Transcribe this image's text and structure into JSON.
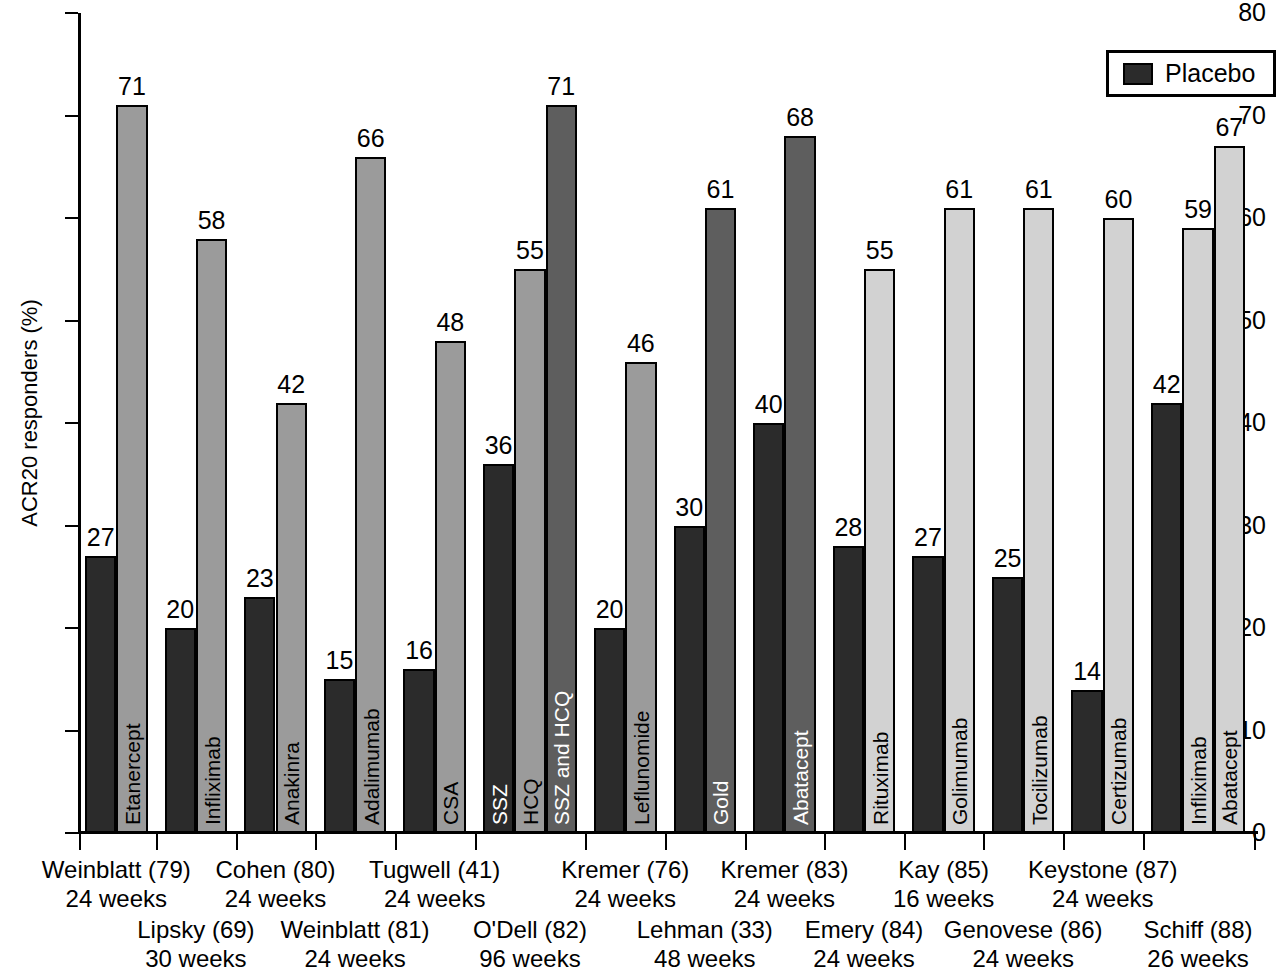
{
  "chart_data": {
    "type": "bar",
    "title": "",
    "xlabel": "",
    "ylabel": "ACR20 responders (%)",
    "ylim": [
      0,
      80
    ],
    "ytick_labels": [
      "0",
      "10",
      "20",
      "30",
      "40",
      "50",
      "60",
      "70",
      "80"
    ],
    "yticks": [
      0,
      10,
      20,
      30,
      40,
      50,
      60,
      70,
      80
    ],
    "grid": false,
    "legend": {
      "position": "top-right",
      "entries": [
        {
          "label": "Placebo",
          "color": "#2b2b2b"
        }
      ]
    },
    "colors": {
      "placebo": "#2b2b2b",
      "active_medium": "#9b9b9b",
      "active_dark": "#5e5e5e",
      "active_light": "#d2d2d2",
      "axis": "#000000"
    },
    "groups": [
      {
        "study": "Weinblatt (79)",
        "weeks": "24 weeks",
        "row": "top",
        "bars": [
          {
            "label": "",
            "value": 27,
            "series": "Placebo",
            "shade": "placebo"
          },
          {
            "label": "Etanercept",
            "value": 71,
            "series": "Active",
            "shade": "active_medium"
          }
        ]
      },
      {
        "study": "Lipsky (69)",
        "weeks": "30 weeks",
        "row": "bottom",
        "bars": [
          {
            "label": "",
            "value": 20,
            "series": "Placebo",
            "shade": "placebo"
          },
          {
            "label": "Infliximab",
            "value": 58,
            "series": "Active",
            "shade": "active_medium"
          }
        ]
      },
      {
        "study": "Cohen (80)",
        "weeks": "24 weeks",
        "row": "top",
        "bars": [
          {
            "label": "",
            "value": 23,
            "series": "Placebo",
            "shade": "placebo"
          },
          {
            "label": "Anakinra",
            "value": 42,
            "series": "Active",
            "shade": "active_medium"
          }
        ]
      },
      {
        "study": "Weinblatt (81)",
        "weeks": "24 weeks",
        "row": "bottom",
        "bars": [
          {
            "label": "",
            "value": 15,
            "series": "Placebo",
            "shade": "placebo"
          },
          {
            "label": "Adalimumab",
            "value": 66,
            "series": "Active",
            "shade": "active_medium"
          }
        ]
      },
      {
        "study": "Tugwell (41)",
        "weeks": "24 weeks",
        "row": "top",
        "bars": [
          {
            "label": "",
            "value": 16,
            "series": "Placebo",
            "shade": "placebo"
          },
          {
            "label": "CSA",
            "value": 48,
            "series": "Active",
            "shade": "active_medium"
          }
        ]
      },
      {
        "study": "O'Dell (82)",
        "weeks": "96 weeks",
        "row": "bottom",
        "bars": [
          {
            "label": "SSZ",
            "value": 36,
            "series": "Placebo",
            "shade": "placebo"
          },
          {
            "label": "HCQ",
            "value": 55,
            "series": "Active",
            "shade": "active_medium"
          },
          {
            "label": "SSZ and HCQ",
            "value": 71,
            "series": "Active",
            "shade": "active_dark"
          }
        ]
      },
      {
        "study": "Kremer (76)",
        "weeks": "24 weeks",
        "row": "top",
        "bars": [
          {
            "label": "",
            "value": 20,
            "series": "Placebo",
            "shade": "placebo"
          },
          {
            "label": "Leflunomide",
            "value": 46,
            "series": "Active",
            "shade": "active_medium"
          }
        ]
      },
      {
        "study": "Lehman (33)",
        "weeks": "48 weeks",
        "row": "bottom",
        "bars": [
          {
            "label": "",
            "value": 30,
            "series": "Placebo",
            "shade": "placebo"
          },
          {
            "label": "Gold",
            "value": 61,
            "series": "Active",
            "shade": "active_dark"
          }
        ]
      },
      {
        "study": "Kremer (83)",
        "weeks": "24 weeks",
        "row": "top",
        "bars": [
          {
            "label": "",
            "value": 40,
            "series": "Placebo",
            "shade": "placebo"
          },
          {
            "label": "Abatacept",
            "value": 68,
            "series": "Active",
            "shade": "active_dark"
          }
        ]
      },
      {
        "study": "Emery (84)",
        "weeks": "24 weeks",
        "row": "bottom",
        "bars": [
          {
            "label": "",
            "value": 28,
            "series": "Placebo",
            "shade": "placebo"
          },
          {
            "label": "Rituximab",
            "value": 55,
            "series": "Active",
            "shade": "active_light"
          }
        ]
      },
      {
        "study": "Kay (85)",
        "weeks": "16 weeks",
        "row": "top",
        "bars": [
          {
            "label": "",
            "value": 27,
            "series": "Placebo",
            "shade": "placebo"
          },
          {
            "label": "Golimumab",
            "value": 61,
            "series": "Active",
            "shade": "active_light"
          }
        ]
      },
      {
        "study": "Genovese (86)",
        "weeks": "24 weeks",
        "row": "bottom",
        "bars": [
          {
            "label": "",
            "value": 25,
            "series": "Placebo",
            "shade": "placebo"
          },
          {
            "label": "Tocilizumab",
            "value": 61,
            "series": "Active",
            "shade": "active_light"
          }
        ]
      },
      {
        "study": "Keystone (87)",
        "weeks": "24 weeks",
        "row": "top",
        "bars": [
          {
            "label": "",
            "value": 14,
            "series": "Placebo",
            "shade": "placebo"
          },
          {
            "label": "Certizumab",
            "value": 60,
            "series": "Active",
            "shade": "active_light"
          }
        ]
      },
      {
        "study": "Schiff (88)",
        "weeks": "26 weeks",
        "row": "bottom",
        "bars": [
          {
            "label": "",
            "value": 42,
            "series": "Placebo",
            "shade": "placebo"
          },
          {
            "label": "Infliximab",
            "value": 59,
            "series": "Active",
            "shade": "active_light"
          },
          {
            "label": "Abatacept",
            "value": 67,
            "series": "Active",
            "shade": "active_light"
          }
        ]
      }
    ]
  }
}
